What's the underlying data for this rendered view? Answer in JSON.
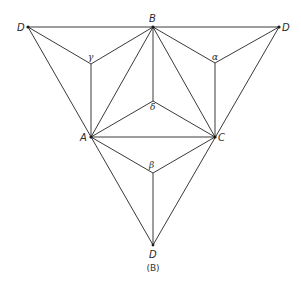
{
  "diagram": {
    "caption": "(B)",
    "colors": {
      "line": "#3a3a3a",
      "background": "#ffffff"
    },
    "points": {
      "D1": {
        "label": "D",
        "x": 28,
        "y": 27
      },
      "B": {
        "label": "B",
        "x": 153,
        "y": 27
      },
      "D2": {
        "label": "D",
        "x": 279,
        "y": 27
      },
      "gamma": {
        "label": "γ",
        "x": 91,
        "y": 64
      },
      "alpha": {
        "label": "α",
        "x": 215,
        "y": 63
      },
      "delta": {
        "label": "δ",
        "x": 153,
        "y": 101
      },
      "A": {
        "label": "A",
        "x": 91,
        "y": 137
      },
      "C": {
        "label": "C",
        "x": 215,
        "y": 137
      },
      "beta": {
        "label": "β",
        "x": 153,
        "y": 173
      },
      "D3": {
        "label": "D",
        "x": 153,
        "y": 245
      }
    },
    "edges": [
      [
        "D1",
        "D2"
      ],
      [
        "D1",
        "D3"
      ],
      [
        "D2",
        "D3"
      ],
      [
        "B",
        "A"
      ],
      [
        "B",
        "C"
      ],
      [
        "A",
        "C"
      ],
      [
        "D1",
        "gamma"
      ],
      [
        "B",
        "gamma"
      ],
      [
        "gamma",
        "A"
      ],
      [
        "D2",
        "alpha"
      ],
      [
        "B",
        "alpha"
      ],
      [
        "alpha",
        "C"
      ],
      [
        "A",
        "beta"
      ],
      [
        "C",
        "beta"
      ],
      [
        "beta",
        "D3"
      ],
      [
        "A",
        "delta"
      ],
      [
        "C",
        "delta"
      ],
      [
        "B",
        "delta"
      ]
    ]
  }
}
